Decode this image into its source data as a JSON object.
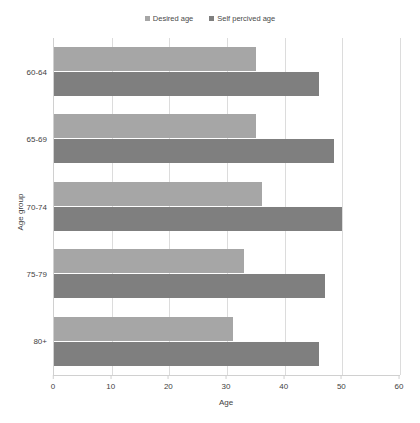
{
  "chart_data": {
    "type": "bar",
    "orientation": "horizontal",
    "title": "",
    "categories": [
      "60-64",
      "65-69",
      "70-74",
      "75-79",
      "80+"
    ],
    "series": [
      {
        "name": "Desired age",
        "color": "#a6a6a6",
        "values": [
          35,
          35,
          36,
          33,
          31
        ]
      },
      {
        "name": "Self percived age",
        "color": "#7f7f7f",
        "values": [
          46,
          48.5,
          50,
          47,
          46
        ]
      }
    ],
    "xlabel": "Age",
    "ylabel": "Age group",
    "xlim": [
      0,
      60
    ],
    "xticks": [
      0,
      10,
      20,
      30,
      40,
      50,
      60
    ],
    "xtick_labels": [
      "0",
      "10",
      "20",
      "30",
      "40",
      "50",
      "60"
    ],
    "grid": "vertical",
    "legend_position": "top-center"
  },
  "legend": {
    "items": [
      {
        "label": "Desired age",
        "color": "#a6a6a6"
      },
      {
        "label": "Self percived age",
        "color": "#7f7f7f"
      }
    ]
  },
  "axes": {
    "x_title": "Age",
    "y_title": "Age group"
  },
  "artifact": {
    "text": ""
  }
}
